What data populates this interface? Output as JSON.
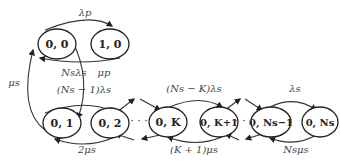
{
  "diagram": {
    "type": "state-transition",
    "nodes": [
      {
        "id": "n00",
        "label": "0, 0"
      },
      {
        "id": "n10",
        "label": "1, 0"
      },
      {
        "id": "n01",
        "label": "0, 1"
      },
      {
        "id": "n02",
        "label": "0, 2"
      },
      {
        "id": "n0K",
        "label": "0, K"
      },
      {
        "id": "n0K1",
        "label": "0, K+1"
      },
      {
        "id": "n0Ns1",
        "label": "0, Ns−1"
      },
      {
        "id": "n0Ns",
        "label": "0, Ns"
      }
    ],
    "edges": [
      {
        "from": "n00",
        "to": "n10",
        "label": "λp"
      },
      {
        "from": "n10",
        "to": "n00",
        "label": "μp"
      },
      {
        "from": "n00",
        "to": "n01",
        "label": "Nsλs"
      },
      {
        "from": "n01",
        "to": "n00",
        "label": "μs"
      },
      {
        "from": "n01",
        "to": "n02",
        "label": "(Ns − 1)λs"
      },
      {
        "from": "n02",
        "to": "n01",
        "label": "2μs"
      },
      {
        "from": "n0K",
        "to": "n0K1",
        "label": "(Ns − K)λs"
      },
      {
        "from": "n0K1",
        "to": "n0K",
        "label": "(K + 1)μs"
      },
      {
        "from": "n0Ns1",
        "to": "n0Ns",
        "label": "λs"
      },
      {
        "from": "n0Ns",
        "to": "n0Ns1",
        "label": "Nsμs"
      }
    ],
    "ellipsis": "· · ·"
  }
}
